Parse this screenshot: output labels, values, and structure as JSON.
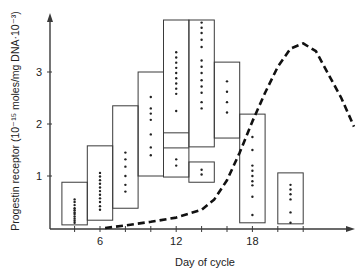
{
  "chart_data": {
    "type": "box",
    "title": "",
    "xlabel": "Day of cycle",
    "ylabel": "Progestin receptor (10⁻¹⁵ moles/mg DNA·10⁻³)",
    "xlim": [
      0,
      26
    ],
    "ylim": [
      0,
      4.2
    ],
    "x_ticks": [
      2,
      4,
      6,
      8,
      10,
      12,
      14,
      16,
      18,
      20,
      22
    ],
    "x_tick_labels": [
      {
        "x": 6,
        "label": "6"
      },
      {
        "x": 12,
        "label": "12"
      },
      {
        "x": 18,
        "label": "18"
      }
    ],
    "y_ticks": [
      {
        "y": 1,
        "label": "1"
      },
      {
        "y": 2,
        "label": "2"
      },
      {
        "y": 3,
        "label": "3"
      }
    ],
    "grid": false,
    "boxes": [
      {
        "day_range": [
          3,
          5
        ],
        "low": 0.06,
        "high": 0.88,
        "points": [
          0.1,
          0.14,
          0.18,
          0.22,
          0.27,
          0.3,
          0.34,
          0.38,
          0.44,
          0.5,
          0.55
        ]
      },
      {
        "day_range": [
          5,
          7
        ],
        "low": 0.15,
        "high": 1.58,
        "points": [
          0.35,
          0.42,
          0.5,
          0.57,
          0.64,
          0.71,
          0.78,
          0.85,
          0.92,
          0.99,
          1.06
        ]
      },
      {
        "day_range": [
          7,
          9
        ],
        "low": 0.38,
        "high": 2.35,
        "points": [
          0.7,
          0.83,
          1.0,
          1.18,
          1.32,
          1.45
        ]
      },
      {
        "day_range": [
          9,
          11
        ],
        "low": 1.0,
        "high": 3.0,
        "points": [
          1.4,
          1.55,
          1.8,
          2.08,
          2.2,
          2.3,
          2.52
        ]
      },
      {
        "day_range": [
          11,
          13
        ],
        "low": 0.98,
        "high": 4.0,
        "inner_lines": [
          1.83,
          1.54
        ],
        "points": [
          1.2,
          1.32,
          2.25,
          2.58,
          2.68,
          2.78,
          2.88,
          2.98,
          3.08,
          3.18,
          3.28,
          3.38
        ]
      },
      {
        "day_range": [
          13,
          15
        ],
        "low": 1.56,
        "high": 4.0,
        "points": [
          2.3,
          2.42,
          2.6,
          2.72,
          2.84,
          2.98,
          3.1,
          3.22,
          3.48,
          3.62,
          3.75,
          3.85,
          3.95
        ]
      },
      {
        "day_range": [
          13,
          15
        ],
        "low": 0.88,
        "high": 1.27,
        "points": [
          1.03,
          1.12
        ]
      },
      {
        "day_range": [
          15,
          17
        ],
        "low": 1.73,
        "high": 3.19,
        "points": [
          2.22,
          2.42,
          2.62,
          2.82
        ]
      },
      {
        "day_range": [
          17,
          19
        ],
        "low": 0.1,
        "high": 2.19,
        "points": [
          0.25,
          0.6,
          0.82,
          0.9,
          1.0,
          1.1,
          1.2,
          1.5,
          1.75
        ]
      },
      {
        "day_range": [
          20,
          22
        ],
        "low": 0.08,
        "high": 1.06,
        "points": [
          0.1,
          0.3,
          0.55,
          0.65,
          0.74,
          0.83
        ]
      }
    ],
    "series": [
      {
        "name": "dashed curve (plasma progesterone trend)",
        "style": "dashed",
        "x": [
          6.4,
          8,
          10,
          12,
          14,
          15,
          16,
          17,
          18,
          19,
          20,
          21,
          22,
          23,
          24,
          25,
          26
        ],
        "y": [
          0.0,
          0.05,
          0.12,
          0.2,
          0.35,
          0.55,
          0.92,
          1.45,
          2.05,
          2.6,
          3.1,
          3.45,
          3.55,
          3.4,
          2.95,
          2.5,
          1.95
        ]
      }
    ],
    "legend": null
  }
}
